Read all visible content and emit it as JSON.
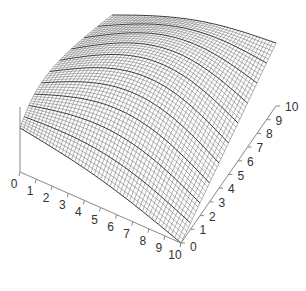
{
  "chart_data": {
    "type": "surface",
    "title": "",
    "x_axis": {
      "label": "",
      "range": [
        0,
        10
      ],
      "ticks": [
        "0",
        "1",
        "2",
        "3",
        "4",
        "5",
        "6",
        "7",
        "8",
        "9",
        "10"
      ]
    },
    "y_axis": {
      "label": "",
      "range": [
        0,
        10
      ],
      "ticks": [
        "0",
        "1",
        "2",
        "3",
        "4",
        "5",
        "6",
        "7",
        "8",
        "9",
        "10"
      ]
    },
    "z_axis": {
      "label": "",
      "ticks": []
    },
    "grid": false,
    "legend": null,
    "mesh": {
      "rows": 50,
      "cols": 50,
      "color": "#555555",
      "background": "#ffffff",
      "highlight_every": 5
    }
  },
  "colors": {
    "axis": "#888888",
    "mesh": "#555555",
    "label": "#333333"
  }
}
